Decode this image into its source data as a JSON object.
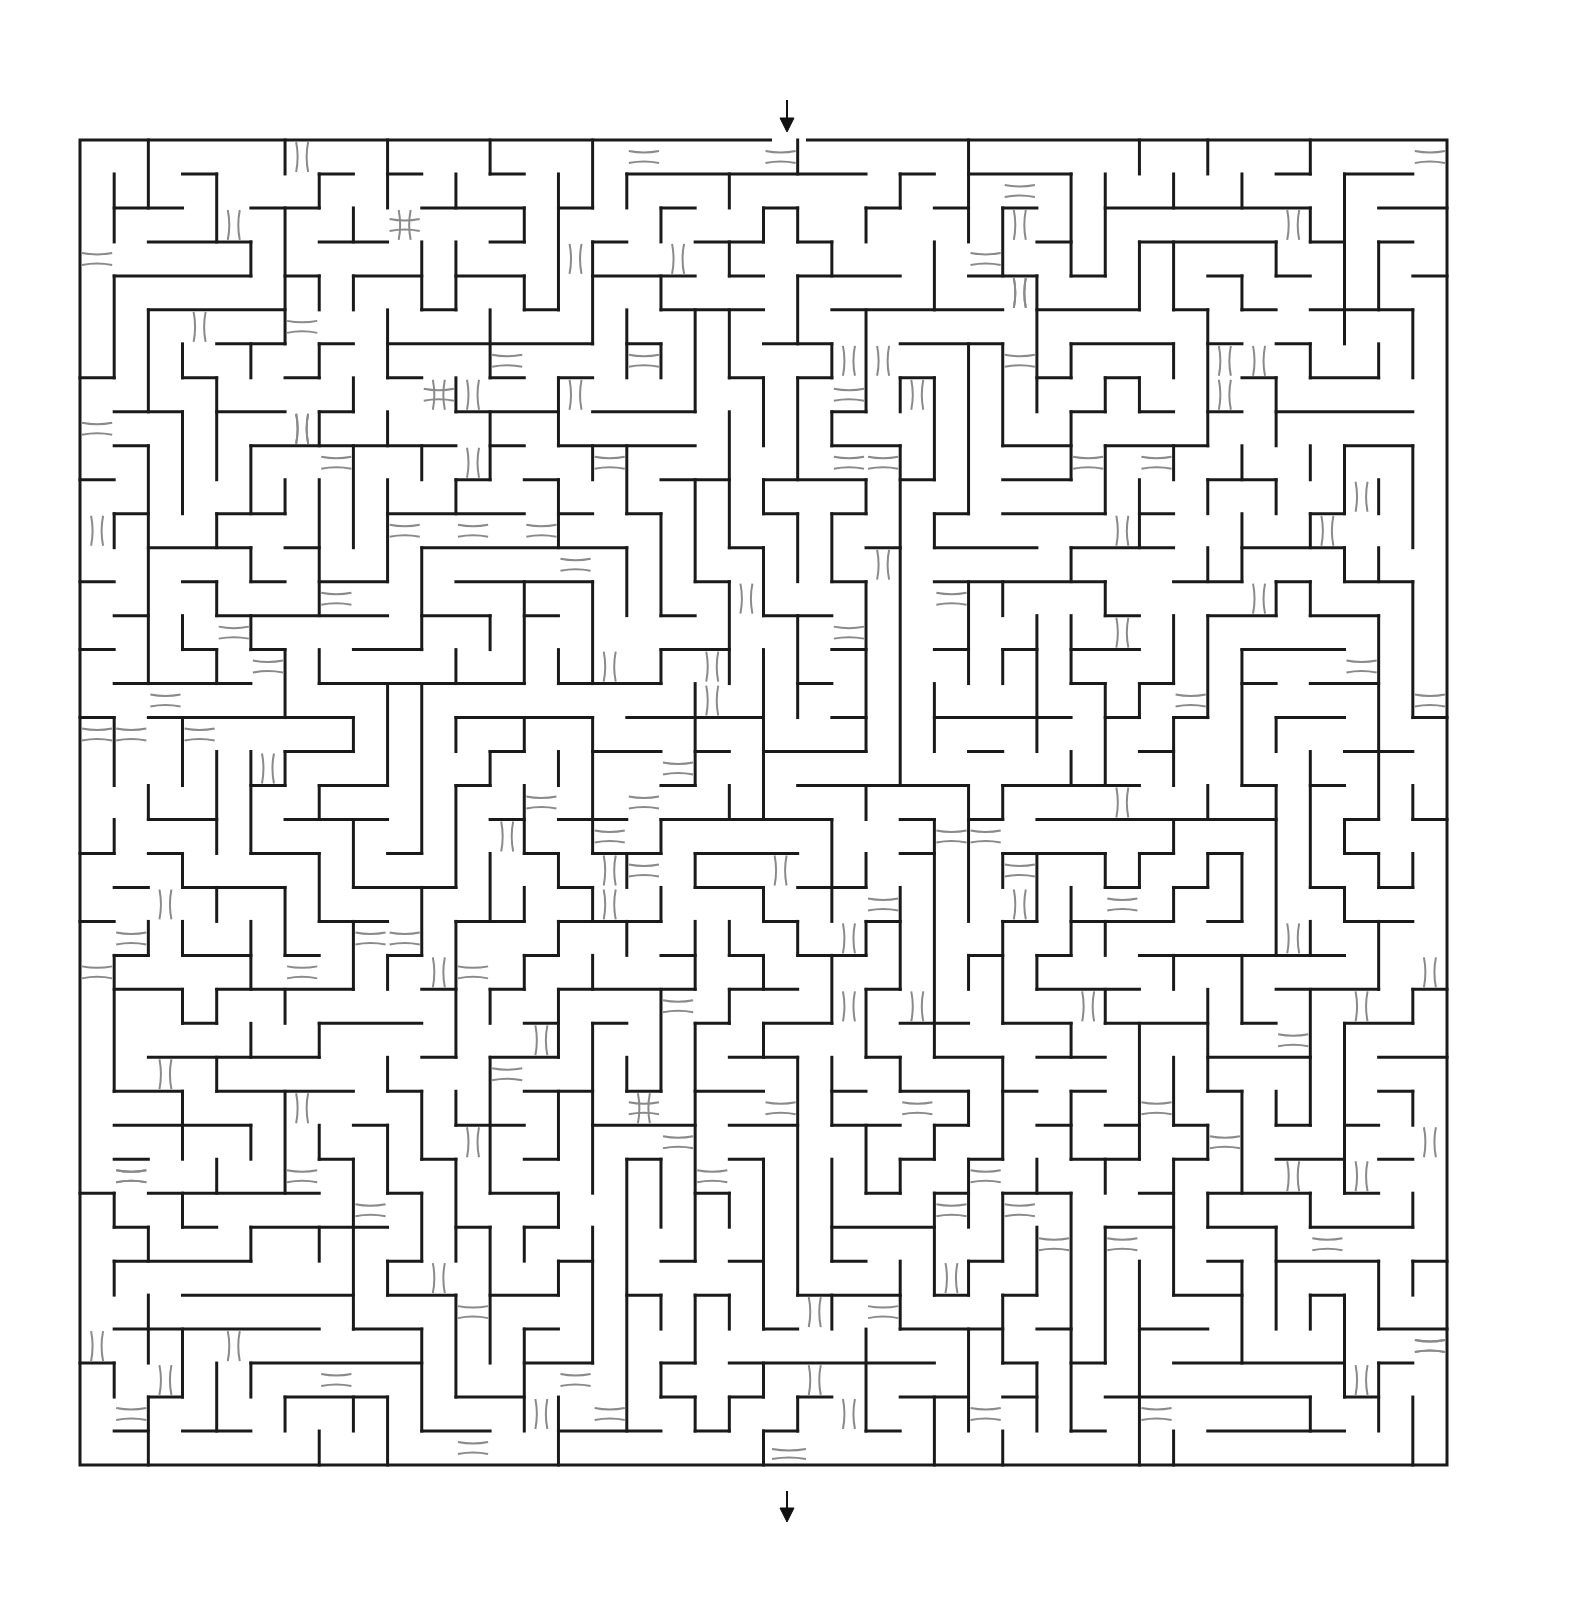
{
  "puzzle": {
    "type": "maze",
    "title": "Maze with bridges",
    "colors": {
      "wall": "#1a1a1a",
      "bridge": "#8a8a8a",
      "background": "#ffffff",
      "arrow": "#111111"
    },
    "frame": {
      "left": 80,
      "top": 140,
      "right": 1447,
      "bottom": 1465
    },
    "grid": {
      "cols": 40,
      "rows": 39,
      "cell": 34.2
    },
    "entrance": {
      "label": "Start",
      "icon": "arrow-down-icon",
      "x": 787,
      "gap_from": 772,
      "gap_to": 806
    },
    "exit": {
      "label": "Finish",
      "icon": "arrow-down-icon",
      "x": 787,
      "gap_from": 772,
      "gap_to": 806
    },
    "seed": 20240611
  }
}
